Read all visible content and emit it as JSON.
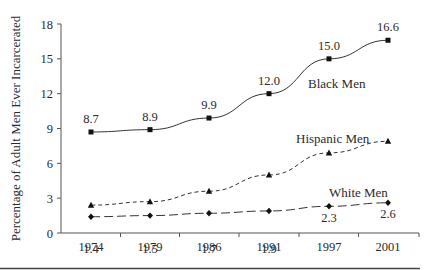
{
  "chart_data": {
    "type": "line",
    "title": "",
    "xlabel": "",
    "ylabel": "Percentage of Adult Men Ever Incarcerated",
    "ylim": [
      0,
      18
    ],
    "yticks": [
      0,
      3,
      6,
      9,
      12,
      15,
      18
    ],
    "grid": false,
    "legend": "inline labels",
    "categories": [
      "1974",
      "1979",
      "1986",
      "1991",
      "1997",
      "2001"
    ],
    "series": [
      {
        "name": "Black Men",
        "marker": "square",
        "line_style": "solid",
        "values": [
          8.7,
          8.9,
          9.9,
          12.0,
          15.0,
          16.6
        ],
        "labels": [
          "8.7",
          "8.9",
          "9.9",
          "12.0",
          "15.0",
          "16.6"
        ]
      },
      {
        "name": "Hispanic Men",
        "marker": "triangle",
        "line_style": "short-dash",
        "values": [
          2.4,
          2.7,
          3.6,
          5.0,
          6.9,
          7.9
        ],
        "labels": []
      },
      {
        "name": "White Men",
        "marker": "diamond",
        "line_style": "long-dash",
        "values": [
          1.4,
          1.5,
          1.7,
          1.9,
          2.3,
          2.6
        ],
        "labels": [
          "1.4",
          "1.5",
          "1.7",
          "1.9",
          "2.3",
          "2.6"
        ]
      }
    ]
  },
  "colors": {
    "line": "#333333",
    "axis": "#555555"
  }
}
